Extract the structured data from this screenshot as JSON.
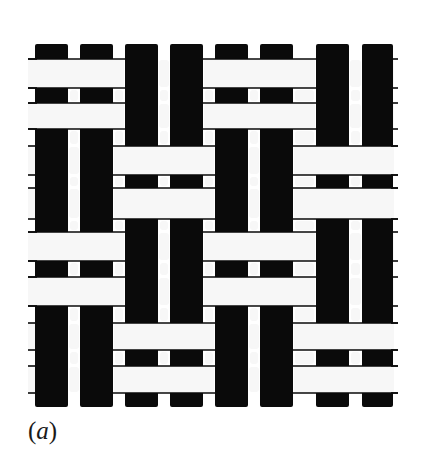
{
  "figure": {
    "panel_label_open": "(",
    "panel_label_letter": "a",
    "panel_label_close": ")",
    "colors": {
      "warp": "#0a0a0a",
      "weft": "#f7f7f7",
      "background": "#ffffff",
      "outline": "#0a0a0a"
    },
    "warp_columns": [
      {
        "x": 35,
        "w": 33
      },
      {
        "x": 80,
        "w": 33
      },
      {
        "x": 125,
        "w": 33
      },
      {
        "x": 170,
        "w": 33
      },
      {
        "x": 215,
        "w": 33
      },
      {
        "x": 260,
        "w": 33
      },
      {
        "x": 316,
        "w": 33
      },
      {
        "x": 362,
        "w": 31
      }
    ],
    "weft_rows": [
      {
        "y": 59,
        "h": 29
      },
      {
        "y": 103,
        "h": 26
      },
      {
        "y": 146,
        "h": 29
      },
      {
        "y": 188,
        "h": 31
      },
      {
        "y": 232,
        "h": 29
      },
      {
        "y": 277,
        "h": 29
      },
      {
        "y": 323,
        "h": 27
      },
      {
        "y": 366,
        "h": 27
      }
    ],
    "grid_top": 44,
    "grid_bottom": 407,
    "grid_left": 28,
    "grid_right": 398,
    "weave_matrix_note": "1 = weft (white) over warp pair; 0 = warp (black) over weft pair; rows = weft pairs, cols = warp pairs",
    "weave_matrix": [
      [
        1,
        0,
        1,
        0
      ],
      [
        0,
        1,
        0,
        1
      ],
      [
        1,
        0,
        1,
        0
      ],
      [
        0,
        1,
        0,
        1
      ]
    ]
  }
}
